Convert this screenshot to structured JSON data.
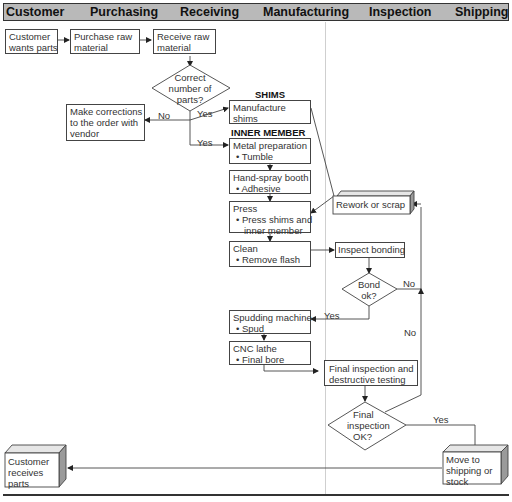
{
  "header": {
    "lanes": [
      "Customer",
      "Purchasing",
      "Receiving",
      "Manufacturing",
      "Inspection",
      "Shipping"
    ]
  },
  "nodes": {
    "customer_wants": {
      "lines": [
        "Customer",
        "wants parts"
      ]
    },
    "purchase_raw": {
      "lines": [
        "Purchase raw",
        "material"
      ]
    },
    "receive_raw": {
      "lines": [
        "Receive raw",
        "material"
      ]
    },
    "correct_parts": {
      "lines": [
        "Correct",
        "number of",
        "parts?"
      ]
    },
    "make_corrections": {
      "lines": [
        "Make corrections",
        "to the order with",
        "vendor"
      ]
    },
    "shims_label": "SHIMS",
    "manufacture_shims": {
      "lines": [
        "Manufacture",
        "shims"
      ]
    },
    "inner_member_label": "INNER MEMBER",
    "metal_prep": {
      "title": "Metal preparation",
      "bullet": "• Tumble"
    },
    "hand_spray": {
      "title": "Hand-spray booth",
      "bullet": "• Adhesive"
    },
    "press": {
      "title": "Press",
      "bullet1": "• Press shims and",
      "bullet2": "inner member"
    },
    "clean": {
      "title": "Clean",
      "bullet": "• Remove flash"
    },
    "rework": {
      "label": "Rework or scrap"
    },
    "inspect_bonding": {
      "label": "Inspect bonding"
    },
    "bond_ok": {
      "lines": [
        "Bond",
        "ok?"
      ]
    },
    "spudding": {
      "title": "Spudding machine",
      "bullet": "• Spud"
    },
    "cnc": {
      "title": "CNC lathe",
      "bullet": "• Final bore"
    },
    "final_inspection": {
      "lines": [
        "Final inspection and",
        "destructive testing"
      ]
    },
    "final_ok": {
      "lines": [
        "Final",
        "inspection",
        "OK?"
      ]
    },
    "move_shipping": {
      "lines": [
        "Move to",
        "shipping or",
        "stock"
      ]
    },
    "customer_receives": {
      "lines": [
        "Customer",
        "receives",
        "parts"
      ]
    }
  },
  "edge_labels": {
    "correct_no": "No",
    "correct_yes_shims": "Yes",
    "correct_yes_inner": "Yes",
    "bond_no": "No",
    "bond_yes": "Yes",
    "final_no": "No",
    "final_yes": "Yes"
  },
  "colors": {
    "header_bg": "#b9b9b9",
    "line": "#444444",
    "cube_side": "#9a9a9a",
    "cube_top": "#e6e6e6"
  }
}
